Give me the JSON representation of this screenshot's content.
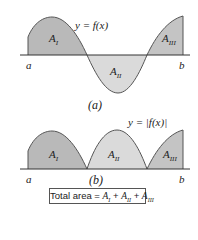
{
  "panel_a": {
    "function_label": "y = f(x)",
    "region_labels": [
      "A_I",
      "A_II",
      "A_III"
    ],
    "left_bound": "a",
    "right_bound": "b",
    "caption": "(a)"
  },
  "panel_b": {
    "function_label": "y = |f(x)|",
    "region_labels": [
      "A_I",
      "A_II",
      "A_III"
    ],
    "left_bound": "a",
    "right_bound": "b",
    "caption": "(b)"
  },
  "formula": {
    "prefix": "Total area = ",
    "terms": [
      "A_I",
      "A_II",
      "A_III"
    ]
  },
  "colors": {
    "region_dark": "#b9b9b9",
    "region_light": "#dadada",
    "curve": "#555555"
  }
}
